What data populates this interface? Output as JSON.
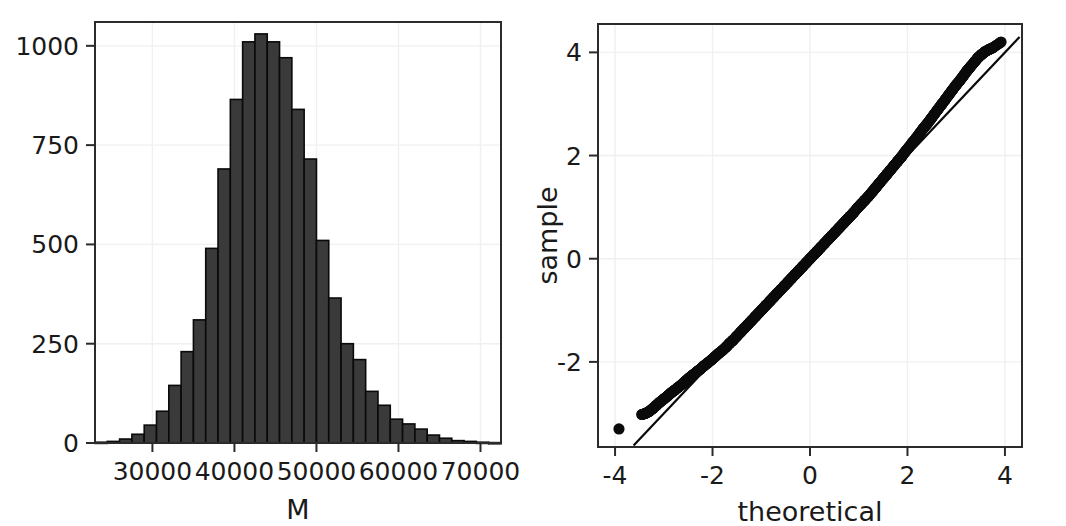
{
  "figure": {
    "panels": [
      "histogram",
      "qq-plot"
    ],
    "background_color": "#ffffff",
    "ink_color": "#0a0a0a",
    "bar_fill_color": "#3a3a3a",
    "grid_color": "#f0f0f0"
  },
  "chart_data": [
    {
      "type": "bar",
      "id": "histogram",
      "title": "",
      "subtitle": "",
      "xlabel": "M",
      "ylabel": "",
      "xlim": [
        23000,
        72500
      ],
      "ylim": [
        0,
        1060
      ],
      "grid": true,
      "legend": false,
      "bin_width": 1500,
      "xtick_labels": [
        "30000",
        "40000",
        "50000",
        "60000",
        "70000"
      ],
      "xtick_values": [
        30000,
        40000,
        50000,
        60000,
        70000
      ],
      "ytick_labels": [
        "0",
        "250",
        "500",
        "750",
        "1000"
      ],
      "ytick_values": [
        0,
        250,
        500,
        750,
        1000
      ],
      "bin_starts": [
        23000,
        24500,
        26000,
        27500,
        29000,
        30500,
        32000,
        33500,
        35000,
        36500,
        38000,
        39500,
        41000,
        42500,
        44000,
        45500,
        47000,
        48500,
        50000,
        51500,
        53000,
        54500,
        56000,
        57500,
        59000,
        60500,
        62000,
        63500,
        65000,
        66500,
        68000,
        69500,
        71000
      ],
      "categories": [
        "23000",
        "24500",
        "26000",
        "27500",
        "29000",
        "30500",
        "32000",
        "33500",
        "35000",
        "36500",
        "38000",
        "39500",
        "41000",
        "42500",
        "44000",
        "45500",
        "47000",
        "48500",
        "50000",
        "51500",
        "53000",
        "54500",
        "56000",
        "57500",
        "59000",
        "60500",
        "62000",
        "63500",
        "65000",
        "66500",
        "68000",
        "69500",
        "71000"
      ],
      "values": [
        2,
        4,
        10,
        22,
        45,
        80,
        145,
        230,
        310,
        490,
        690,
        865,
        1010,
        1030,
        1010,
        970,
        840,
        715,
        510,
        365,
        250,
        210,
        130,
        95,
        60,
        48,
        35,
        20,
        12,
        6,
        4,
        2,
        1
      ]
    },
    {
      "type": "scatter",
      "id": "qq-plot",
      "title": "",
      "subtitle": "",
      "xlabel": "theoretical",
      "ylabel": "sample",
      "xlim": [
        -4.35,
        4.35
      ],
      "ylim": [
        -3.65,
        4.55
      ],
      "grid": true,
      "legend": false,
      "xtick_labels": [
        "-4",
        "-2",
        "0",
        "2",
        "4"
      ],
      "xtick_values": [
        -4,
        -2,
        0,
        2,
        4
      ],
      "ytick_labels": [
        "-2",
        "0",
        "2",
        "4"
      ],
      "ytick_values": [
        -2,
        0,
        2,
        4
      ],
      "reference_line": {
        "name": "qq-reference-line",
        "slope": 1.0,
        "intercept": 0.0,
        "x_start": -3.62,
        "x_end": 4.3
      },
      "annotations": [
        {
          "name": "lower-outlier",
          "x": -3.92,
          "y": -3.3
        },
        {
          "name": "upper-outlier",
          "x": 3.92,
          "y": 4.2
        }
      ],
      "points": [
        [
          -3.92,
          -3.3
        ],
        [
          -3.45,
          -3.02
        ],
        [
          -3.38,
          -3.0
        ],
        [
          -3.3,
          -2.96
        ],
        [
          -3.22,
          -2.9
        ],
        [
          -3.15,
          -2.84
        ],
        [
          -3.08,
          -2.78
        ],
        [
          -3.0,
          -2.72
        ],
        [
          -2.92,
          -2.66
        ],
        [
          -2.85,
          -2.6
        ],
        [
          -2.78,
          -2.55
        ],
        [
          -2.7,
          -2.49
        ],
        [
          -2.62,
          -2.43
        ],
        [
          -2.55,
          -2.37
        ],
        [
          -2.48,
          -2.31
        ],
        [
          -2.4,
          -2.25
        ],
        [
          -2.32,
          -2.19
        ],
        [
          -2.25,
          -2.14
        ],
        [
          -2.18,
          -2.08
        ],
        [
          -2.1,
          -2.02
        ],
        [
          -2.02,
          -1.96
        ],
        [
          -1.95,
          -1.9
        ],
        [
          -1.88,
          -1.84
        ],
        [
          -1.8,
          -1.78
        ],
        [
          -1.72,
          -1.71
        ],
        [
          -1.65,
          -1.64
        ],
        [
          -1.58,
          -1.58
        ],
        [
          -1.5,
          -1.5
        ],
        [
          -1.42,
          -1.42
        ],
        [
          -1.35,
          -1.35
        ],
        [
          -1.28,
          -1.28
        ],
        [
          -1.2,
          -1.2
        ],
        [
          -1.12,
          -1.12
        ],
        [
          -1.05,
          -1.05
        ],
        [
          -0.98,
          -0.98
        ],
        [
          -0.9,
          -0.9
        ],
        [
          -0.82,
          -0.82
        ],
        [
          -0.75,
          -0.75
        ],
        [
          -0.68,
          -0.68
        ],
        [
          -0.6,
          -0.6
        ],
        [
          -0.52,
          -0.52
        ],
        [
          -0.45,
          -0.45
        ],
        [
          -0.38,
          -0.38
        ],
        [
          -0.3,
          -0.3
        ],
        [
          -0.22,
          -0.22
        ],
        [
          -0.15,
          -0.15
        ],
        [
          -0.08,
          -0.08
        ],
        [
          0.0,
          0.0
        ],
        [
          0.08,
          0.08
        ],
        [
          0.15,
          0.15
        ],
        [
          0.22,
          0.22
        ],
        [
          0.3,
          0.3
        ],
        [
          0.38,
          0.38
        ],
        [
          0.45,
          0.45
        ],
        [
          0.52,
          0.52
        ],
        [
          0.6,
          0.6
        ],
        [
          0.68,
          0.68
        ],
        [
          0.75,
          0.75
        ],
        [
          0.82,
          0.82
        ],
        [
          0.9,
          0.9
        ],
        [
          0.98,
          0.99
        ],
        [
          1.05,
          1.06
        ],
        [
          1.12,
          1.13
        ],
        [
          1.2,
          1.21
        ],
        [
          1.28,
          1.3
        ],
        [
          1.35,
          1.38
        ],
        [
          1.42,
          1.46
        ],
        [
          1.5,
          1.55
        ],
        [
          1.58,
          1.64
        ],
        [
          1.65,
          1.72
        ],
        [
          1.72,
          1.8
        ],
        [
          1.8,
          1.89
        ],
        [
          1.88,
          1.98
        ],
        [
          1.95,
          2.07
        ],
        [
          2.02,
          2.15
        ],
        [
          2.1,
          2.25
        ],
        [
          2.18,
          2.34
        ],
        [
          2.25,
          2.43
        ],
        [
          2.32,
          2.52
        ],
        [
          2.4,
          2.61
        ],
        [
          2.48,
          2.71
        ],
        [
          2.55,
          2.8
        ],
        [
          2.62,
          2.89
        ],
        [
          2.7,
          2.99
        ],
        [
          2.78,
          3.09
        ],
        [
          2.85,
          3.18
        ],
        [
          2.92,
          3.27
        ],
        [
          3.0,
          3.37
        ],
        [
          3.08,
          3.46
        ],
        [
          3.15,
          3.55
        ],
        [
          3.22,
          3.64
        ],
        [
          3.3,
          3.73
        ],
        [
          3.38,
          3.82
        ],
        [
          3.45,
          3.9
        ],
        [
          3.52,
          3.96
        ],
        [
          3.6,
          4.02
        ],
        [
          3.68,
          4.06
        ],
        [
          3.75,
          4.09
        ],
        [
          3.92,
          4.2
        ]
      ]
    }
  ]
}
